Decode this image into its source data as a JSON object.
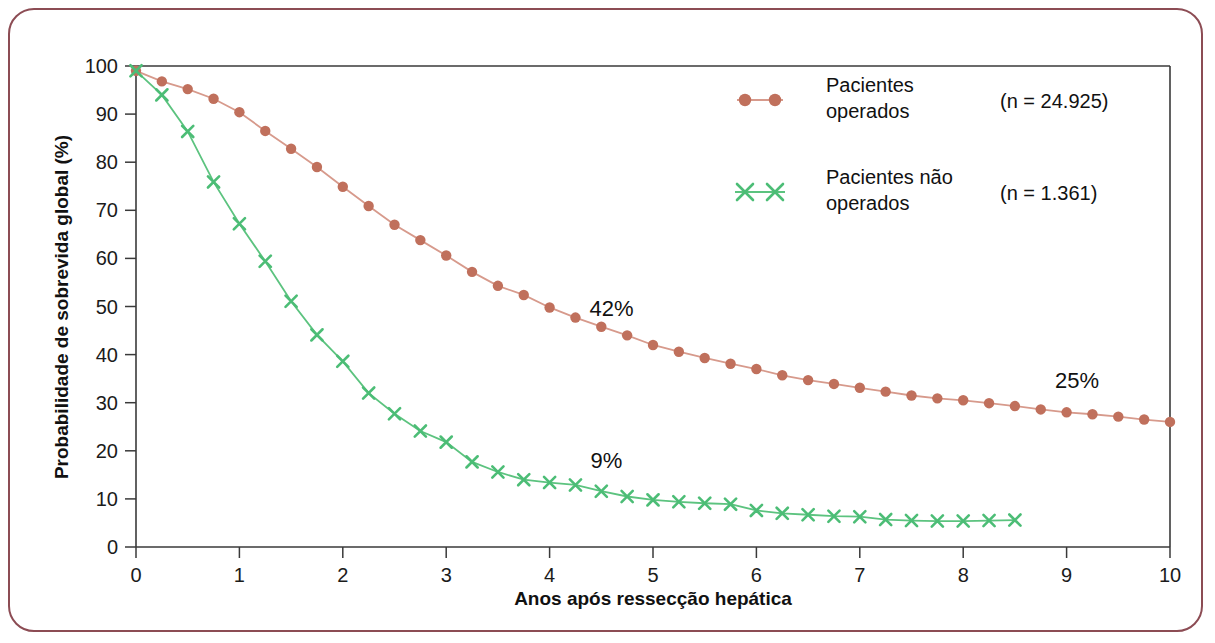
{
  "figure": {
    "border_color": "#8c4c54",
    "background": "#ffffff"
  },
  "chart_data": {
    "type": "line",
    "title": "",
    "subtitle": "",
    "xlabel": "Anos após ressecção hepática",
    "ylabel": "Probabilidade de sobrevida global (%)",
    "xlim": [
      0,
      10
    ],
    "ylim": [
      0,
      100
    ],
    "xticks": [
      0,
      1,
      2,
      3,
      4,
      5,
      6,
      7,
      8,
      9,
      10
    ],
    "yticks": [
      0,
      10,
      20,
      30,
      40,
      50,
      60,
      70,
      80,
      90,
      100
    ],
    "xtick_labels": [
      "0",
      "1",
      "2",
      "3",
      "4",
      "5",
      "6",
      "7",
      "8",
      "9",
      "10"
    ],
    "ytick_labels": [
      "0",
      "10",
      "20",
      "30",
      "40",
      "50",
      "60",
      "70",
      "80",
      "90",
      "100"
    ],
    "grid": false,
    "legend_position": "top-right",
    "series": [
      {
        "name": "Pacientes operados",
        "n_label": "(n = 24.925)",
        "color": "#c0705c",
        "line_color": "#d79a8c",
        "marker": "circle",
        "x": [
          0,
          0.25,
          0.5,
          0.75,
          1,
          1.25,
          1.5,
          1.75,
          2,
          2.25,
          2.5,
          2.75,
          3,
          3.25,
          3.5,
          3.75,
          4,
          4.25,
          4.5,
          4.75,
          5,
          5.25,
          5.5,
          5.75,
          6,
          6.25,
          6.5,
          6.75,
          7,
          7.25,
          7.5,
          7.75,
          8,
          8.25,
          8.5,
          8.75,
          9,
          9.25,
          9.5,
          9.75,
          10
        ],
        "y": [
          99,
          96.8,
          95.2,
          93.2,
          90.4,
          86.5,
          82.8,
          79,
          74.9,
          70.9,
          67,
          63.8,
          60.6,
          57.2,
          54.3,
          52.4,
          49.8,
          47.7,
          45.8,
          44,
          42,
          40.6,
          39.3,
          38.1,
          37,
          35.7,
          34.7,
          33.9,
          33.1,
          32.3,
          31.5,
          30.9,
          30.5,
          29.9,
          29.3,
          28.6,
          28,
          27.6,
          27.1,
          26.5,
          26
        ]
      },
      {
        "name": "Pacientes não operados",
        "n_label": "(n = 1.361)",
        "color": "#4cbd76",
        "line_color": "#5cc37f",
        "marker": "cross",
        "x": [
          0,
          0.25,
          0.5,
          0.75,
          1,
          1.25,
          1.5,
          1.75,
          2,
          2.25,
          2.5,
          2.75,
          3,
          3.25,
          3.5,
          3.75,
          4,
          4.25,
          4.5,
          4.75,
          5,
          5.25,
          5.5,
          5.75,
          6,
          6.25,
          6.5,
          6.75,
          7,
          7.25,
          7.5,
          7.75,
          8,
          8.25,
          8.5
        ],
        "y": [
          99,
          94,
          86.4,
          75.9,
          67.2,
          59.4,
          51.1,
          44.1,
          38.6,
          32,
          27.7,
          24.1,
          21.8,
          17.7,
          15.6,
          14,
          13.4,
          12.9,
          11.6,
          10.5,
          9.8,
          9.4,
          9.1,
          8.9,
          7.6,
          7,
          6.7,
          6.4,
          6.3,
          5.7,
          5.5,
          5.4,
          5.4,
          5.5,
          5.6
        ]
      }
    ],
    "annotations": [
      {
        "text": "42%",
        "x": 4.6,
        "y": 48,
        "name": "annotation-42-percent"
      },
      {
        "text": "25%",
        "x": 9.1,
        "y": 33,
        "name": "annotation-25-percent"
      },
      {
        "text": "9%",
        "x": 4.55,
        "y": 16.5,
        "name": "annotation-9-percent"
      }
    ]
  },
  "legend": {
    "entries": [
      {
        "label_line1": "Pacientes",
        "label_line2": "operados",
        "n": "(n = 24.925)",
        "marker": "circle",
        "color": "#c0705c"
      },
      {
        "label_line1": "Pacientes não",
        "label_line2": "operados",
        "n": "(n = 1.361)",
        "marker": "cross",
        "color": "#4cbd76"
      }
    ]
  }
}
